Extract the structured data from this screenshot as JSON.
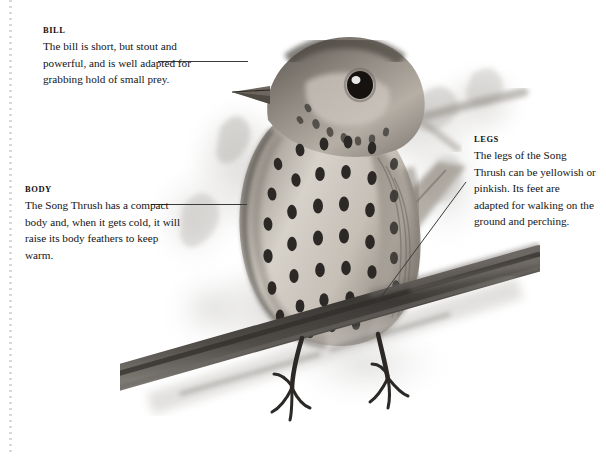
{
  "page": {
    "background": "#ffffff",
    "rule_color": "#d8d8d8",
    "text_color": "#141414",
    "leader_color": "#3a3a3a"
  },
  "annotations": [
    {
      "id": "bill",
      "heading": "BILL",
      "text": "The bill is short, but stout and powerful, and is well adapted for grabbing hold of small prey."
    },
    {
      "id": "body",
      "heading": "BODY",
      "text": "The Song Thrush has a compact body and, when it gets cold, it will raise its body feathers to keep warm."
    },
    {
      "id": "legs",
      "heading": "LEGS",
      "text": "The legs of the Song Thrush can be yellowish or pinkish. Its feet are adapted for walking on the ground and perching."
    }
  ],
  "illustration": {
    "subject": "song-thrush",
    "description": "Pencil and wash illustration of a Song Thrush perched on a branch, facing right, with a heavily spotted breast.",
    "palette": {
      "plumage_light": "#d9d4cc",
      "plumage_mid": "#a8a29a",
      "plumage_dark": "#6d6862",
      "spot": "#2e2b28",
      "branch": "#4a4743",
      "wash": "#c9c7c3"
    }
  }
}
